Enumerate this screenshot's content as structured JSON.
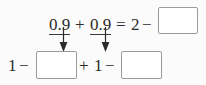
{
  "worksheet": {
    "type": "arithmetic-fill-in-the-blank",
    "background_color": "#fbfbfb",
    "text_color": "#2b2b2b",
    "box_border_color": "#9a9a9a",
    "box_fill_color": "#ffffff",
    "arrow_color": "#2b2b2b",
    "rows": [
      {
        "name": "top-equation",
        "tokens": [
          {
            "id": "t0",
            "text": "0.9",
            "underlined": true
          },
          {
            "id": "t1",
            "text": "+",
            "underlined": false
          },
          {
            "id": "t2",
            "text": "0.9",
            "underlined": true
          },
          {
            "id": "t3",
            "text": "=",
            "underlined": false
          },
          {
            "id": "t4",
            "text": "2",
            "underlined": false
          },
          {
            "id": "t5",
            "text": "−",
            "underlined": false
          }
        ],
        "boxes": [
          {
            "id": "box-top-1",
            "value": ""
          }
        ]
      },
      {
        "name": "bottom-equation",
        "tokens": [
          {
            "id": "b0",
            "text": "1",
            "underlined": false
          },
          {
            "id": "b1",
            "text": "−",
            "underlined": false
          },
          {
            "id": "b2",
            "text": "+",
            "underlined": false
          },
          {
            "id": "b3",
            "text": "1",
            "underlined": false
          },
          {
            "id": "b4",
            "text": "−",
            "underlined": false
          }
        ],
        "boxes": [
          {
            "id": "box-bottom-1",
            "value": ""
          },
          {
            "id": "box-bottom-2",
            "value": ""
          }
        ]
      }
    ],
    "arrows": [
      {
        "id": "arrow-1",
        "from": "0.9 (first term)",
        "to": "box-bottom-1",
        "direction": "down"
      },
      {
        "id": "arrow-2",
        "from": "0.9 (second term)",
        "to": "box-bottom-2",
        "direction": "down"
      }
    ]
  }
}
